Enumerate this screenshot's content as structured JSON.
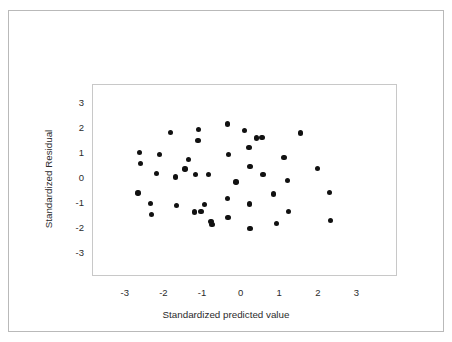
{
  "chart_data": {
    "type": "scatter",
    "title": "",
    "xlabel": "Standardized predicted value",
    "ylabel": "Standardized Residual",
    "xlim": [
      -3.85,
      4.05
    ],
    "ylim": [
      -3.9,
      3.75
    ],
    "xticks": [
      -3,
      -2,
      -1,
      0,
      1,
      2,
      3
    ],
    "xticklabels": [
      "-3",
      "-2",
      "-1",
      "0",
      "1",
      "2",
      "3"
    ],
    "yticks": [
      3,
      2,
      1,
      0,
      -1,
      -2,
      -3
    ],
    "yticklabels": [
      "3",
      "2",
      "1",
      "0",
      "-1",
      "-2",
      "-3"
    ],
    "grid": false,
    "legend": null,
    "marker": {
      "shape": "circle",
      "color": "#111111",
      "size": 5.4
    },
    "n_points": 48,
    "points": [
      {
        "x": -2.65,
        "y": 1.06
      },
      {
        "x": -2.62,
        "y": 0.63
      },
      {
        "x": -2.68,
        "y": -0.55
      },
      {
        "x": -2.36,
        "y": -0.96
      },
      {
        "x": -2.34,
        "y": -1.42
      },
      {
        "x": -2.13,
        "y": 0.98
      },
      {
        "x": -2.21,
        "y": 0.22
      },
      {
        "x": -1.84,
        "y": 1.86
      },
      {
        "x": -1.71,
        "y": 0.08
      },
      {
        "x": -1.69,
        "y": -1.06
      },
      {
        "x": -1.47,
        "y": 0.41
      },
      {
        "x": -1.37,
        "y": 0.77
      },
      {
        "x": -1.11,
        "y": 1.98
      },
      {
        "x": -1.13,
        "y": 1.55
      },
      {
        "x": -1.19,
        "y": 0.18
      },
      {
        "x": -1.22,
        "y": -1.31
      },
      {
        "x": -1.05,
        "y": -1.29
      },
      {
        "x": -0.97,
        "y": -1.01
      },
      {
        "x": -0.86,
        "y": 0.18
      },
      {
        "x": -0.79,
        "y": -1.69
      },
      {
        "x": -0.77,
        "y": -1.81
      },
      {
        "x": -0.36,
        "y": 2.2
      },
      {
        "x": -0.34,
        "y": 0.98
      },
      {
        "x": -0.36,
        "y": -0.78
      },
      {
        "x": -0.35,
        "y": -1.52
      },
      {
        "x": -0.15,
        "y": -0.11
      },
      {
        "x": 0.08,
        "y": 1.94
      },
      {
        "x": 0.19,
        "y": 1.26
      },
      {
        "x": 0.22,
        "y": 0.5
      },
      {
        "x": 0.2,
        "y": -0.99
      },
      {
        "x": 0.22,
        "y": -1.97
      },
      {
        "x": 0.38,
        "y": 1.64
      },
      {
        "x": 0.53,
        "y": 1.66
      },
      {
        "x": 0.55,
        "y": 0.18
      },
      {
        "x": 0.82,
        "y": -0.59
      },
      {
        "x": 0.9,
        "y": -1.78
      },
      {
        "x": 1.1,
        "y": 0.86
      },
      {
        "x": 1.19,
        "y": -0.05
      },
      {
        "x": 1.22,
        "y": -1.28
      },
      {
        "x": 1.52,
        "y": 1.84
      },
      {
        "x": 1.96,
        "y": 0.42
      },
      {
        "x": 2.28,
        "y": -0.53
      },
      {
        "x": 2.3,
        "y": -1.66
      }
    ]
  }
}
